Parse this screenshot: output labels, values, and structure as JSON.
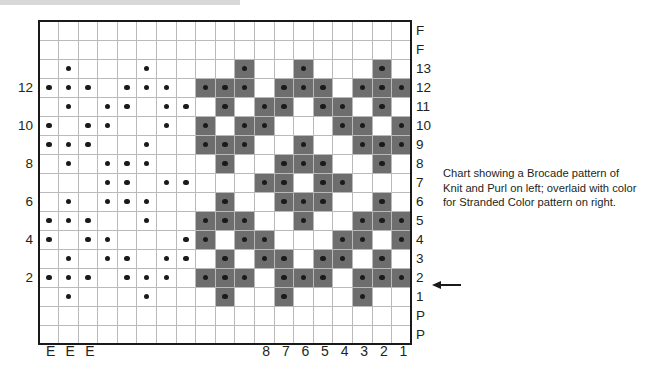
{
  "chart_data": {
    "type": "heatmap",
    "grid_columns": 19,
    "grid_rows": 17,
    "legend": {
      "shaded_color": "#6e6e6e",
      "plain_color": "#ffffff",
      "dot_color": "#1a1a1a",
      "dot_meaning": "purl stitch",
      "shaded_meaning": "contrast color stitch"
    },
    "row_labels_right": [
      "F",
      "F",
      "13",
      "12",
      "11",
      "10",
      "9",
      "8",
      "7",
      "6",
      "5",
      "4",
      "3",
      "2",
      "1",
      "P",
      "P"
    ],
    "row_labels_left": [
      "",
      "",
      "",
      "12",
      "",
      "10",
      "",
      "8",
      "",
      "6",
      "",
      "4",
      "",
      "2",
      "",
      "",
      ""
    ],
    "column_labels_bottom": [
      "E",
      "E",
      "E",
      "",
      "",
      "",
      "",
      "",
      "",
      "",
      "",
      "8",
      "7",
      "6",
      "5",
      "4",
      "3",
      "2",
      "1"
    ],
    "vertical_divider_after_columns": [
      3,
      11
    ],
    "horizontal_divider_after_rows": [
      2,
      15
    ],
    "dots": [
      [
        0,
        0,
        0,
        0,
        0,
        0,
        0,
        0,
        0,
        0,
        0,
        0,
        0,
        0,
        0,
        0,
        0,
        0,
        0
      ],
      [
        0,
        0,
        0,
        0,
        0,
        0,
        0,
        0,
        0,
        0,
        0,
        0,
        0,
        0,
        0,
        0,
        0,
        0,
        0
      ],
      [
        0,
        1,
        0,
        0,
        0,
        1,
        0,
        0,
        0,
        0,
        1,
        0,
        0,
        1,
        0,
        0,
        0,
        1,
        0
      ],
      [
        1,
        1,
        1,
        0,
        1,
        1,
        1,
        0,
        1,
        1,
        1,
        0,
        1,
        1,
        1,
        0,
        1,
        1,
        1
      ],
      [
        0,
        1,
        0,
        1,
        1,
        0,
        1,
        1,
        0,
        1,
        0,
        1,
        1,
        0,
        1,
        1,
        0,
        1,
        0
      ],
      [
        1,
        0,
        1,
        1,
        0,
        0,
        1,
        0,
        1,
        0,
        1,
        1,
        0,
        0,
        0,
        1,
        1,
        0,
        1
      ],
      [
        1,
        1,
        1,
        0,
        0,
        1,
        0,
        0,
        1,
        1,
        1,
        0,
        0,
        1,
        0,
        0,
        1,
        1,
        1
      ],
      [
        0,
        1,
        0,
        1,
        1,
        1,
        0,
        0,
        0,
        1,
        0,
        0,
        1,
        1,
        1,
        0,
        0,
        1,
        0
      ],
      [
        0,
        0,
        0,
        1,
        1,
        0,
        1,
        1,
        0,
        0,
        0,
        1,
        1,
        0,
        1,
        1,
        0,
        0,
        0
      ],
      [
        0,
        1,
        0,
        1,
        1,
        1,
        0,
        0,
        0,
        1,
        0,
        0,
        1,
        1,
        1,
        0,
        0,
        1,
        0
      ],
      [
        1,
        1,
        1,
        0,
        0,
        1,
        0,
        0,
        1,
        1,
        1,
        0,
        0,
        1,
        0,
        0,
        1,
        1,
        1
      ],
      [
        1,
        0,
        1,
        1,
        0,
        0,
        0,
        1,
        1,
        0,
        1,
        1,
        0,
        0,
        0,
        1,
        1,
        0,
        1
      ],
      [
        0,
        1,
        0,
        1,
        1,
        0,
        1,
        1,
        0,
        1,
        0,
        1,
        1,
        0,
        1,
        1,
        0,
        1,
        0
      ],
      [
        1,
        1,
        1,
        0,
        1,
        1,
        1,
        0,
        1,
        1,
        1,
        0,
        1,
        1,
        1,
        0,
        1,
        1,
        1
      ],
      [
        0,
        1,
        0,
        0,
        0,
        1,
        0,
        0,
        0,
        1,
        0,
        0,
        1,
        0,
        0,
        0,
        1,
        0,
        0
      ],
      [
        0,
        0,
        0,
        0,
        0,
        0,
        0,
        0,
        0,
        0,
        0,
        0,
        0,
        0,
        0,
        0,
        0,
        0,
        0
      ],
      [
        0,
        0,
        0,
        0,
        0,
        0,
        0,
        0,
        0,
        0,
        0,
        0,
        0,
        0,
        0,
        0,
        0,
        0,
        0
      ]
    ],
    "shaded": [
      [
        0,
        0,
        0,
        0,
        0,
        0,
        0,
        0,
        0,
        0,
        0,
        0,
        0,
        0,
        0,
        0,
        0,
        0,
        0
      ],
      [
        0,
        0,
        0,
        0,
        0,
        0,
        0,
        0,
        0,
        0,
        0,
        0,
        0,
        0,
        0,
        0,
        0,
        0,
        0
      ],
      [
        0,
        0,
        0,
        0,
        0,
        0,
        0,
        0,
        0,
        0,
        1,
        0,
        0,
        1,
        0,
        0,
        0,
        1,
        0
      ],
      [
        0,
        0,
        0,
        0,
        0,
        0,
        0,
        0,
        1,
        1,
        1,
        0,
        1,
        1,
        1,
        0,
        1,
        1,
        1
      ],
      [
        0,
        0,
        0,
        0,
        0,
        0,
        0,
        0,
        0,
        1,
        0,
        1,
        1,
        0,
        1,
        1,
        0,
        1,
        0
      ],
      [
        0,
        0,
        0,
        0,
        0,
        0,
        0,
        0,
        1,
        0,
        1,
        1,
        0,
        0,
        0,
        1,
        1,
        0,
        1
      ],
      [
        0,
        0,
        0,
        0,
        0,
        0,
        0,
        0,
        1,
        1,
        1,
        0,
        0,
        1,
        0,
        0,
        1,
        1,
        1
      ],
      [
        0,
        0,
        0,
        0,
        0,
        0,
        0,
        0,
        0,
        1,
        0,
        0,
        1,
        1,
        1,
        0,
        0,
        1,
        0
      ],
      [
        0,
        0,
        0,
        0,
        0,
        0,
        0,
        0,
        0,
        0,
        0,
        1,
        1,
        0,
        1,
        1,
        0,
        0,
        0
      ],
      [
        0,
        0,
        0,
        0,
        0,
        0,
        0,
        0,
        0,
        1,
        0,
        0,
        1,
        1,
        1,
        0,
        0,
        1,
        0
      ],
      [
        0,
        0,
        0,
        0,
        0,
        0,
        0,
        0,
        1,
        1,
        1,
        0,
        0,
        1,
        0,
        0,
        1,
        1,
        1
      ],
      [
        0,
        0,
        0,
        0,
        0,
        0,
        0,
        0,
        1,
        0,
        1,
        1,
        0,
        0,
        0,
        1,
        1,
        0,
        1
      ],
      [
        0,
        0,
        0,
        0,
        0,
        0,
        0,
        0,
        0,
        1,
        0,
        1,
        1,
        0,
        1,
        1,
        0,
        1,
        0
      ],
      [
        0,
        0,
        0,
        0,
        0,
        0,
        0,
        0,
        1,
        1,
        1,
        0,
        1,
        1,
        1,
        0,
        1,
        1,
        1
      ],
      [
        0,
        0,
        0,
        0,
        0,
        0,
        0,
        0,
        0,
        1,
        0,
        0,
        1,
        0,
        0,
        0,
        1,
        0,
        0
      ],
      [
        0,
        0,
        0,
        0,
        0,
        0,
        0,
        0,
        0,
        0,
        0,
        0,
        0,
        0,
        0,
        0,
        0,
        0,
        0
      ],
      [
        0,
        0,
        0,
        0,
        0,
        0,
        0,
        0,
        0,
        0,
        0,
        0,
        0,
        0,
        0,
        0,
        0,
        0,
        0
      ]
    ]
  },
  "annotations": {
    "row1_arrow": "arrow pointing to row 1"
  },
  "caption": {
    "line1": "Chart showing a Brocade pattern of",
    "line2": "Knit and Purl on left; overlaid with color",
    "line3": "for Stranded Color pattern on right."
  }
}
